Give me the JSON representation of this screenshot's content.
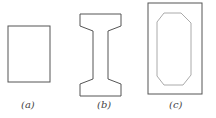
{
  "figure": {
    "panels": [
      {
        "id": "a",
        "label": "(a)",
        "shape": "solid rectangle cross-section"
      },
      {
        "id": "b",
        "label": "(b)",
        "shape": "I-beam cross-section"
      },
      {
        "id": "c",
        "label": "(c)",
        "shape": "hollow box cross-section with octagonal void"
      }
    ],
    "colors": {
      "outline": "#555555",
      "inner_outline": "#aaaaaa",
      "background": "#ffffff"
    }
  }
}
